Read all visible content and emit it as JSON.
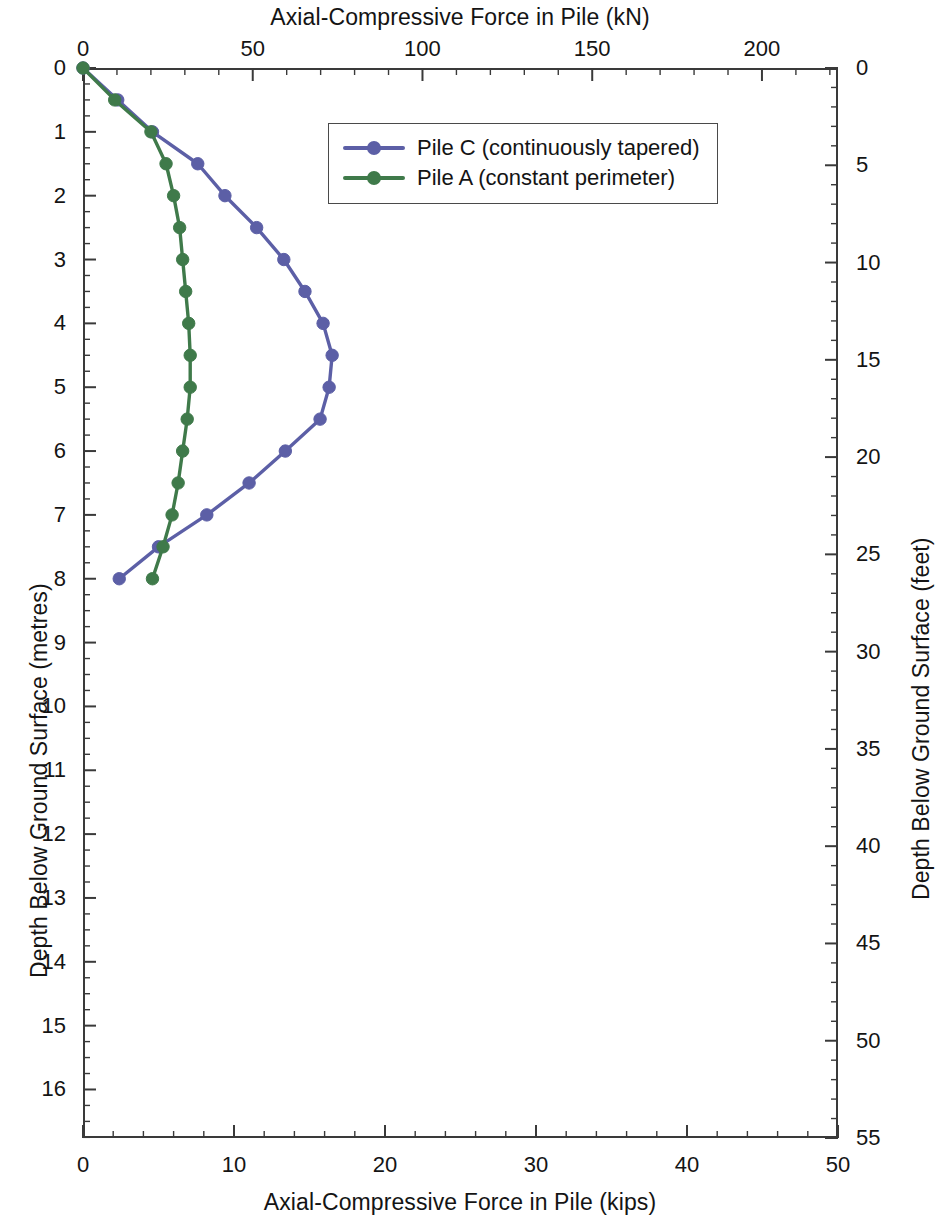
{
  "chart_data": {
    "type": "line",
    "title": "",
    "orientation": "vertical-depth-profile",
    "top_axis": {
      "label": "Axial-Compressive Force in Pile (kN)",
      "ticks": [
        0,
        50,
        100,
        150,
        200
      ],
      "range": [
        0,
        222.4
      ],
      "minor_tick_step": 10
    },
    "bottom_axis": {
      "label": "Axial-Compressive Force in Pile (kips)",
      "ticks": [
        0,
        10,
        20,
        30,
        40,
        50
      ],
      "range": [
        0,
        50
      ],
      "minor_tick_step": 2
    },
    "left_axis": {
      "label": "Depth Below Ground Surface (metres)",
      "ticks": [
        0,
        1,
        2,
        3,
        4,
        5,
        6,
        7,
        8,
        9,
        10,
        11,
        12,
        13,
        14,
        15,
        16
      ],
      "range": [
        0,
        16.76
      ],
      "minor_tick_step": 0.25,
      "inverted": true
    },
    "right_axis": {
      "label": "Depth Below Ground Surface (feet)",
      "ticks": [
        0,
        5,
        10,
        15,
        20,
        25,
        30,
        35,
        40,
        45,
        50,
        55
      ],
      "range": [
        0,
        55
      ],
      "minor_tick_step": 1,
      "inverted": true
    },
    "xlabel": "Axial-Compressive Force in Pile (kips)",
    "ylabel": "Depth Below Ground Surface (metres)",
    "grid": false,
    "legend_position": "top-center-inside",
    "series": [
      {
        "name": "Pile C (continuously tapered)",
        "color": "#5c5fa6",
        "marker": "circle",
        "x_units": "kips",
        "y_units": "metres",
        "points": [
          {
            "depth_m": 0.0,
            "force_kips": 0.0,
            "force_kN": 0.0
          },
          {
            "depth_m": 0.5,
            "force_kips": 2.3,
            "force_kN": 10.2
          },
          {
            "depth_m": 1.0,
            "force_kips": 4.6,
            "force_kN": 20.5
          },
          {
            "depth_m": 1.5,
            "force_kips": 7.6,
            "force_kN": 33.8
          },
          {
            "depth_m": 2.0,
            "force_kips": 9.4,
            "force_kN": 41.8
          },
          {
            "depth_m": 2.5,
            "force_kips": 11.5,
            "force_kN": 51.2
          },
          {
            "depth_m": 3.0,
            "force_kips": 13.3,
            "force_kN": 59.2
          },
          {
            "depth_m": 3.5,
            "force_kips": 14.7,
            "force_kN": 65.4
          },
          {
            "depth_m": 4.0,
            "force_kips": 15.9,
            "force_kN": 70.7
          },
          {
            "depth_m": 4.5,
            "force_kips": 16.5,
            "force_kN": 73.4
          },
          {
            "depth_m": 5.0,
            "force_kips": 16.3,
            "force_kN": 72.5
          },
          {
            "depth_m": 5.5,
            "force_kips": 15.7,
            "force_kN": 69.8
          },
          {
            "depth_m": 6.0,
            "force_kips": 13.4,
            "force_kN": 59.6
          },
          {
            "depth_m": 6.5,
            "force_kips": 11.0,
            "force_kN": 48.9
          },
          {
            "depth_m": 7.0,
            "force_kips": 8.2,
            "force_kN": 36.5
          },
          {
            "depth_m": 7.5,
            "force_kips": 5.0,
            "force_kN": 22.2
          },
          {
            "depth_m": 8.0,
            "force_kips": 2.4,
            "force_kN": 10.7
          }
        ]
      },
      {
        "name": "Pile A (constant perimeter)",
        "color": "#3f7a4a",
        "marker": "circle",
        "x_units": "kips",
        "y_units": "metres",
        "points": [
          {
            "depth_m": 0.0,
            "force_kips": 0.0,
            "force_kN": 0.0
          },
          {
            "depth_m": 0.5,
            "force_kips": 2.1,
            "force_kN": 9.3
          },
          {
            "depth_m": 1.0,
            "force_kips": 4.5,
            "force_kN": 20.0
          },
          {
            "depth_m": 1.5,
            "force_kips": 5.5,
            "force_kN": 24.5
          },
          {
            "depth_m": 2.0,
            "force_kips": 6.0,
            "force_kN": 26.7
          },
          {
            "depth_m": 2.5,
            "force_kips": 6.4,
            "force_kN": 28.5
          },
          {
            "depth_m": 3.0,
            "force_kips": 6.6,
            "force_kN": 29.4
          },
          {
            "depth_m": 3.5,
            "force_kips": 6.8,
            "force_kN": 30.2
          },
          {
            "depth_m": 4.0,
            "force_kips": 7.0,
            "force_kN": 31.1
          },
          {
            "depth_m": 4.5,
            "force_kips": 7.1,
            "force_kN": 31.6
          },
          {
            "depth_m": 5.0,
            "force_kips": 7.1,
            "force_kN": 31.6
          },
          {
            "depth_m": 5.5,
            "force_kips": 6.9,
            "force_kN": 30.7
          },
          {
            "depth_m": 6.0,
            "force_kips": 6.6,
            "force_kN": 29.4
          },
          {
            "depth_m": 6.5,
            "force_kips": 6.3,
            "force_kN": 28.0
          },
          {
            "depth_m": 7.0,
            "force_kips": 5.9,
            "force_kN": 26.2
          },
          {
            "depth_m": 7.5,
            "force_kips": 5.3,
            "force_kN": 23.6
          },
          {
            "depth_m": 8.0,
            "force_kips": 4.6,
            "force_kN": 20.5
          }
        ]
      }
    ]
  },
  "legend": {
    "items": [
      {
        "label": "Pile C (continuously tapered)",
        "color": "#5c5fa6"
      },
      {
        "label": "Pile A (constant perimeter)",
        "color": "#3f7a4a"
      }
    ]
  },
  "axes": {
    "top_title": "Axial-Compressive Force in Pile (kN)",
    "bottom_title": "Axial-Compressive Force in Pile (kips)",
    "left_title": "Depth Below Ground Surface (metres)",
    "right_title": "Depth Below Ground Surface (feet)",
    "top_ticks": [
      "0",
      "50",
      "100",
      "150",
      "200"
    ],
    "bottom_ticks": [
      "0",
      "10",
      "20",
      "30",
      "40",
      "50"
    ],
    "left_ticks": [
      "0",
      "1",
      "2",
      "3",
      "4",
      "5",
      "6",
      "7",
      "8",
      "9",
      "10",
      "11",
      "12",
      "13",
      "14",
      "15",
      "16"
    ],
    "right_ticks": [
      "0",
      "5",
      "10",
      "15",
      "20",
      "25",
      "30",
      "35",
      "40",
      "45",
      "50",
      "55"
    ]
  },
  "colors": {
    "pile_c": "#5c5fa6",
    "pile_a": "#3f7a4a",
    "axis": "#3a3a3a",
    "text": "#141414",
    "background": "#ffffff"
  }
}
